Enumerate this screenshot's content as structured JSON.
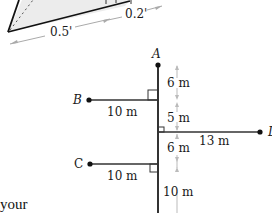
{
  "top_figure": {
    "dimensions": [
      "0.5'",
      "0.2'"
    ]
  },
  "main_figure": {
    "points": {
      "A": "A",
      "B": "B",
      "C": "C",
      "D": "D"
    },
    "horizontal_lengths": {
      "B": "10 m",
      "C": "10 m",
      "D": "13 m"
    },
    "vertical_segments": [
      "6 m",
      "5 m",
      "6 m",
      "10 m"
    ]
  },
  "caption_fragment": "your"
}
